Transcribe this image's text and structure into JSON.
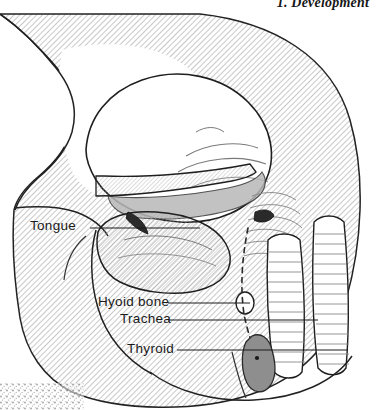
{
  "page": {
    "width": 377,
    "height": 410,
    "background_color": "#ffffff",
    "ink_color": "#1a1a1a",
    "hatch_color": "#8f8f8f",
    "shade_color": "#9a9a9a",
    "figure_type": "anatomical-line-drawing"
  },
  "header": {
    "title": "1. Development"
  },
  "annotations": {
    "items": [
      {
        "id": "tongue",
        "label": "Tongue",
        "leader_from_x": 90,
        "leader_from_y": 228,
        "leader_to_x": 200,
        "leader_to_y": 228
      },
      {
        "id": "hyoid-bone",
        "label": "Hyoid bone",
        "leader_from_x": 168,
        "leader_from_y": 303,
        "leader_to_x": 250,
        "leader_to_y": 303
      },
      {
        "id": "trachea",
        "label": "Trachea",
        "leader_from_x": 168,
        "leader_from_y": 320,
        "leader_to_x": 318,
        "leader_to_y": 320
      },
      {
        "id": "thyroid",
        "label": "Thyroid",
        "leader_from_x": 177,
        "leader_from_y": 350,
        "leader_to_x": 348,
        "leader_to_y": 350
      }
    ]
  },
  "structures": {
    "thyroid_gland_fill": "#8e8e8e",
    "hyoid_bone_shape": "small-oval",
    "trachea_path": "dashed-descending-line",
    "tracheal_rings": "two-vertical-ridged-tubes"
  },
  "artifact": {
    "name": "scan-edge-noise",
    "corner": "bottom-left"
  }
}
